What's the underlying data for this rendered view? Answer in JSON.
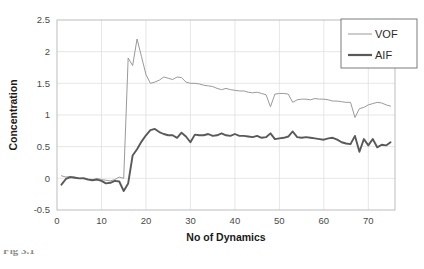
{
  "figure": {
    "caption_partial": "Fig 3.1"
  },
  "chart_data": {
    "type": "line",
    "title": "",
    "xlabel": "No of Dynamics",
    "ylabel": "Concentration",
    "xlim": [
      0,
      76
    ],
    "ylim": [
      -0.5,
      2.5
    ],
    "xticks": [
      0,
      10,
      20,
      30,
      40,
      50,
      60,
      70
    ],
    "yticks": [
      -0.5,
      0,
      0.5,
      1,
      1.5,
      2,
      2.5
    ],
    "xtick_labels": [
      "0",
      "10",
      "20",
      "30",
      "40",
      "50",
      "60",
      "70"
    ],
    "ytick_labels": [
      "-0.5",
      "0",
      "0.5",
      "1",
      "1.5",
      "2",
      "2.5"
    ],
    "grid": true,
    "grid_x": true,
    "grid_y": true,
    "legend_position": "top-right",
    "colors": {
      "VOF": "#9a9a9a",
      "AIF": "#595959",
      "grid": "#dcdcdc",
      "frame": "#b5b5b5",
      "text": "#4a4a4a"
    },
    "x": [
      1,
      2,
      3,
      4,
      5,
      6,
      7,
      8,
      9,
      10,
      11,
      12,
      13,
      14,
      15,
      16,
      17,
      18,
      19,
      20,
      21,
      22,
      23,
      24,
      25,
      26,
      27,
      28,
      29,
      30,
      31,
      32,
      33,
      34,
      35,
      36,
      37,
      38,
      39,
      40,
      41,
      42,
      43,
      44,
      45,
      46,
      47,
      48,
      49,
      50,
      51,
      52,
      53,
      54,
      55,
      56,
      57,
      58,
      59,
      60,
      61,
      62,
      63,
      64,
      65,
      66,
      67,
      68,
      69,
      70,
      71,
      72,
      73,
      74,
      75
    ],
    "series": [
      {
        "name": "VOF",
        "color": "#9a9a9a",
        "line_width": 1.0,
        "values": [
          0.04,
          0.02,
          0.03,
          0.02,
          0.0,
          0.01,
          -0.01,
          -0.02,
          0.0,
          -0.02,
          -0.03,
          -0.04,
          -0.02,
          0.02,
          0.0,
          1.9,
          1.78,
          2.2,
          1.92,
          1.64,
          1.5,
          1.52,
          1.55,
          1.6,
          1.58,
          1.56,
          1.6,
          1.59,
          1.52,
          1.5,
          1.5,
          1.49,
          1.47,
          1.46,
          1.45,
          1.42,
          1.4,
          1.42,
          1.4,
          1.39,
          1.38,
          1.38,
          1.36,
          1.35,
          1.36,
          1.34,
          1.32,
          1.13,
          1.33,
          1.34,
          1.34,
          1.33,
          1.2,
          1.24,
          1.25,
          1.25,
          1.24,
          1.26,
          1.25,
          1.25,
          1.24,
          1.22,
          1.22,
          1.21,
          1.2,
          1.2,
          0.96,
          1.1,
          1.12,
          1.16,
          1.18,
          1.2,
          1.19,
          1.16,
          1.14
        ]
      },
      {
        "name": "AIF",
        "color": "#595959",
        "line_width": 1.9,
        "values": [
          -0.1,
          -0.01,
          0.02,
          0.01,
          0.0,
          0.0,
          -0.02,
          -0.03,
          -0.02,
          -0.04,
          -0.08,
          -0.07,
          -0.04,
          -0.05,
          -0.2,
          -0.08,
          0.36,
          0.46,
          0.58,
          0.68,
          0.76,
          0.78,
          0.73,
          0.7,
          0.68,
          0.68,
          0.64,
          0.72,
          0.66,
          0.57,
          0.69,
          0.68,
          0.68,
          0.7,
          0.67,
          0.68,
          0.71,
          0.68,
          0.67,
          0.7,
          0.67,
          0.67,
          0.66,
          0.65,
          0.67,
          0.64,
          0.65,
          0.71,
          0.62,
          0.63,
          0.64,
          0.66,
          0.74,
          0.65,
          0.64,
          0.65,
          0.64,
          0.63,
          0.62,
          0.61,
          0.63,
          0.64,
          0.61,
          0.57,
          0.55,
          0.54,
          0.67,
          0.42,
          0.62,
          0.52,
          0.62,
          0.49,
          0.53,
          0.52,
          0.57
        ]
      }
    ],
    "legend": [
      {
        "label": "VOF",
        "color": "#9a9a9a",
        "line_width": 1.0
      },
      {
        "label": "AIF",
        "color": "#595959",
        "line_width": 2.2
      }
    ]
  }
}
